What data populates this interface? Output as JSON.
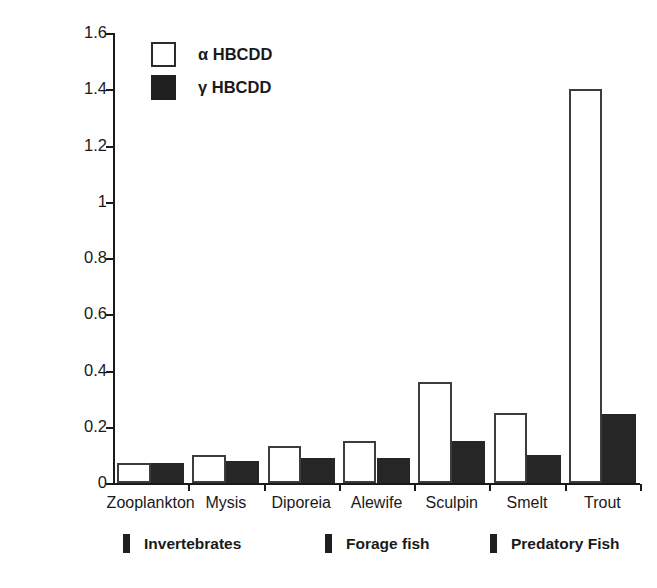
{
  "chart_data": {
    "type": "bar",
    "title": "",
    "xlabel": "",
    "ylabel": "Concentration ng/g wt",
    "ylim": [
      0,
      1.6
    ],
    "yticks": [
      "0",
      "0.2",
      "0.4",
      "0.6",
      "0.8",
      "1",
      "1.2",
      "1.4",
      "1.6"
    ],
    "ytick_values": [
      0,
      0.2,
      0.4,
      0.6,
      0.8,
      1,
      1.2,
      1.4,
      1.6
    ],
    "grid": false,
    "legend_position": "upper-left-inside",
    "categories": [
      "Zooplankton",
      "Mysis",
      "Diporeia",
      "Alewife",
      "Sculpin",
      "Smelt",
      "Trout"
    ],
    "series": [
      {
        "name": "α HBCDD",
        "fill": "open",
        "color": "#ffffff",
        "values": [
          0.07,
          0.1,
          0.13,
          0.15,
          0.36,
          0.25,
          1.4
        ]
      },
      {
        "name": "γ HBCDD",
        "fill": "solid",
        "color": "#262626",
        "values": [
          0.07,
          0.08,
          0.09,
          0.09,
          0.15,
          0.1,
          0.245
        ]
      }
    ],
    "annotations": [
      {
        "label": "Invertebrates",
        "marker": "bar",
        "spans": [
          "Zooplankton",
          "Mysis",
          "Diporeia"
        ]
      },
      {
        "label": "Forage fish",
        "marker": "bar",
        "spans": [
          "Alewife",
          "Sculpin",
          "Smelt"
        ]
      },
      {
        "label": "Predatory Fish",
        "marker": "bar",
        "spans": [
          "Trout"
        ]
      }
    ]
  },
  "legend": {
    "items": [
      {
        "label": "α HBCDD"
      },
      {
        "label": "γ HBCDD"
      }
    ]
  },
  "axes": {
    "y_title": "Concentration ng/g wt"
  }
}
